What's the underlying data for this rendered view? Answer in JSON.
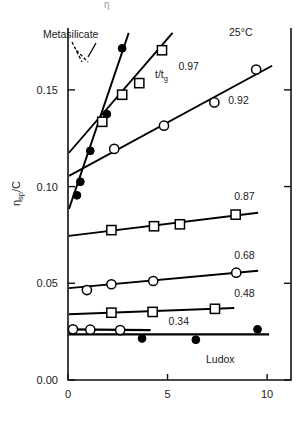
{
  "figure": {
    "top_partial_glyph": "η",
    "y_axis_label": "η",
    "y_axis_label_sub": "sp",
    "y_axis_label_tail": "/C",
    "temperature_note": "25°C",
    "ratio_symbol": "t/t",
    "ratio_symbol_sub": "g",
    "annotation_metasilicate": "Metasilicate",
    "annotation_ludox": "Ludox"
  },
  "chart_data": {
    "type": "line",
    "title": "",
    "subtitle": "",
    "xlabel": "",
    "ylabel": "ηsp/C",
    "xlim": [
      0,
      11.2
    ],
    "ylim": [
      0.0,
      0.182
    ],
    "grid": false,
    "legend": "inline-labels-right",
    "annotations": [
      {
        "text": "25°C",
        "x": 9.3,
        "y": 0.178
      },
      {
        "text": "t/tg 0.97",
        "x": 5.4,
        "y": 0.1605
      },
      {
        "text": "Metasilicate",
        "x": 1.35,
        "y": 0.1755
      },
      {
        "text": "Ludox",
        "x": 8.2,
        "y": 0.0105
      }
    ],
    "xticks": [
      0,
      5,
      10
    ],
    "xticklabels": [
      "0",
      "5",
      "10"
    ],
    "yticks": [
      0.0,
      0.05,
      0.1,
      0.15
    ],
    "yticklabels": [
      "0.00",
      "0.05",
      "0.10",
      "0.15"
    ],
    "series": [
      {
        "name": "Metasilicate",
        "label": "Metasilicate",
        "marker": "filled-circle",
        "x": [
          0.45,
          0.62,
          1.12,
          1.95,
          2.72
        ],
        "y": [
          0.0955,
          0.1025,
          0.1185,
          0.1375,
          0.1715
        ],
        "fit_x": [
          0.05,
          3.05
        ],
        "fit_y": [
          0.0885,
          0.1795
        ]
      },
      {
        "name": "0.97",
        "label": "0.97",
        "marker": "open-square",
        "x": [
          1.72,
          2.72,
          3.58,
          4.72
        ],
        "y": [
          0.1335,
          0.1475,
          0.1535,
          0.1705
        ],
        "fit_x": [
          0.05,
          5.25
        ],
        "fit_y": [
          0.1175,
          0.1795
        ]
      },
      {
        "name": "0.92",
        "label": "0.92",
        "marker": "open-circle",
        "x": [
          2.32,
          4.82,
          7.35,
          9.45
        ],
        "y": [
          0.1195,
          0.1315,
          0.1435,
          0.1605
        ],
        "fit_x": [
          0.05,
          10.25
        ],
        "fit_y": [
          0.1055,
          0.1625
        ]
      },
      {
        "name": "0.87",
        "label": "0.87",
        "marker": "open-square",
        "x": [
          2.18,
          4.32,
          5.62,
          8.42
        ],
        "y": [
          0.0775,
          0.0795,
          0.0805,
          0.0855
        ],
        "fit_x": [
          0.05,
          9.55
        ],
        "fit_y": [
          0.0745,
          0.0865
        ]
      },
      {
        "name": "0.68",
        "label": "0.68",
        "marker": "open-circle",
        "x": [
          0.95,
          2.18,
          4.28,
          8.45
        ],
        "y": [
          0.0465,
          0.0495,
          0.0512,
          0.0555
        ],
        "fit_x": [
          0.05,
          9.55
        ],
        "fit_y": [
          0.0475,
          0.0565
        ]
      },
      {
        "name": "0.48",
        "label": "0.48",
        "marker": "open-square",
        "x": [
          2.18,
          4.25,
          7.38
        ],
        "y": [
          0.0348,
          0.0352,
          0.0368
        ],
        "fit_x": [
          0.05,
          8.35
        ],
        "fit_y": [
          0.034,
          0.0372
        ]
      },
      {
        "name": "0.34",
        "label": "0.34",
        "marker": "open-circle",
        "x": [
          0.25,
          1.12,
          2.62
        ],
        "y": [
          0.0262,
          0.026,
          0.0258
        ],
        "fit_x": [
          0.02,
          4.15
        ],
        "fit_y": [
          0.0262,
          0.0258
        ]
      },
      {
        "name": "Ludox",
        "label": "Ludox",
        "marker": "filled-circle",
        "x": [
          3.72,
          6.42,
          9.52
        ],
        "y": [
          0.0215,
          0.0208,
          0.0262
        ],
        "fit_x": [
          0.02,
          10.1
        ],
        "fit_y": [
          0.0236,
          0.0236
        ]
      }
    ],
    "series_labels": [
      {
        "text": "0.97",
        "x": 5.55,
        "y": 0.1605
      },
      {
        "text": "0.92",
        "x": 8.05,
        "y": 0.1425
      },
      {
        "text": "0.87",
        "x": 8.35,
        "y": 0.0932
      },
      {
        "text": "0.68",
        "x": 8.35,
        "y": 0.0628
      },
      {
        "text": "0.48",
        "x": 8.35,
        "y": 0.0428
      },
      {
        "text": "0.34",
        "x": 5.05,
        "y": 0.0282
      }
    ]
  }
}
